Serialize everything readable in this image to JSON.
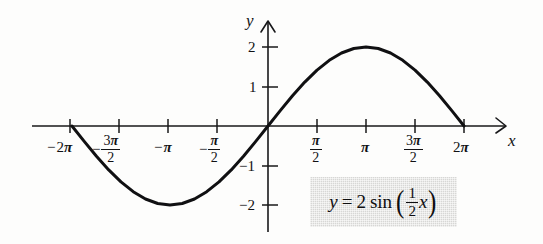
{
  "chart_data": {
    "type": "line",
    "title": "",
    "equation": "y = 2 sin ( 1/2 x )",
    "function": "y = 2*sin(0.5*x)",
    "amplitude": 2,
    "period": "4π",
    "xlabel": "x",
    "ylabel": "y",
    "xlim": [
      -7.5,
      7.9
    ],
    "ylim": [
      -2.6,
      2.6
    ],
    "grid": false,
    "legend": "none",
    "x_ticks": [
      {
        "value": -6.2832,
        "label": "−2π"
      },
      {
        "value": -4.7124,
        "label": "−3π/2"
      },
      {
        "value": -3.1416,
        "label": "−π"
      },
      {
        "value": -1.5708,
        "label": "−π/2"
      },
      {
        "value": 1.5708,
        "label": "π/2"
      },
      {
        "value": 3.1416,
        "label": "π"
      },
      {
        "value": 4.7124,
        "label": "3π/2"
      },
      {
        "value": 6.2832,
        "label": "2π"
      }
    ],
    "y_ticks": [
      {
        "value": 2,
        "label": "2"
      },
      {
        "value": 1,
        "label": "1"
      },
      {
        "value": -1,
        "label": "−1"
      },
      {
        "value": -2,
        "label": "−2"
      }
    ],
    "key_points": [
      {
        "x": -6.2832,
        "y": 0,
        "kind": "zero"
      },
      {
        "x": -3.1416,
        "y": -2,
        "kind": "minimum"
      },
      {
        "x": 0,
        "y": 0,
        "kind": "zero"
      },
      {
        "x": 3.1416,
        "y": 2,
        "kind": "maximum"
      },
      {
        "x": 6.2832,
        "y": 0,
        "kind": "zero"
      }
    ],
    "x": [
      -6.2832,
      -5.8905,
      -5.4978,
      -5.1051,
      -4.7124,
      -4.3197,
      -3.927,
      -3.5343,
      -3.1416,
      -2.7489,
      -2.3562,
      -1.9635,
      -1.5708,
      -1.1781,
      -0.7854,
      -0.3927,
      0,
      0.3927,
      0.7854,
      1.1781,
      1.5708,
      1.9635,
      2.3562,
      2.7489,
      3.1416,
      3.5343,
      3.927,
      4.3197,
      4.7124,
      5.1051,
      5.4978,
      5.8905,
      6.2832
    ],
    "y": [
      0,
      -0.3902,
      -0.7654,
      -1.1111,
      -1.4142,
      -1.6629,
      -1.8478,
      -1.9616,
      -2,
      -1.9616,
      -1.8478,
      -1.6629,
      -1.4142,
      -1.1111,
      -0.7654,
      -0.3902,
      0,
      0.3902,
      0.7654,
      1.1111,
      1.4142,
      1.6629,
      1.8478,
      1.9616,
      2,
      1.9616,
      1.8478,
      1.6629,
      1.4142,
      1.1111,
      0.7654,
      0.3902,
      0
    ]
  },
  "axes": {
    "y_axis_name": "y",
    "x_axis_name": "x"
  },
  "tick_labels": {
    "neg_two_pi": {
      "sign": "−",
      "num": "2",
      "pi": "π"
    },
    "neg_three_pi_over_two": {
      "sign": "−",
      "num": "3",
      "pi": "π",
      "den": "2"
    },
    "neg_pi": {
      "sign": "−",
      "pi": "π"
    },
    "neg_pi_over_two": {
      "sign": "−",
      "pi": "π",
      "den": "2"
    },
    "pi_over_two": {
      "pi": "π",
      "den": "2"
    },
    "pi": {
      "pi": "π"
    },
    "three_pi_over_two": {
      "num": "3",
      "pi": "π",
      "den": "2"
    },
    "two_pi": {
      "num": "2",
      "pi": "π"
    },
    "y_two": "2",
    "y_one": "1",
    "y_neg_one": "−1",
    "y_neg_two": "−2"
  },
  "equation_box": {
    "lhs": "y",
    "equals": "=",
    "coefficient": "2",
    "func": "sin",
    "open_paren": "(",
    "frac_num": "1",
    "frac_den": "2",
    "variable": "x",
    "close_paren": ")",
    "background_color": "#d7d7d5"
  },
  "colors": {
    "curve": "#101012",
    "axis": "#18181a",
    "text": "#111113",
    "background": "#fdfdfc",
    "box_fill": "#d7d7d5"
  }
}
